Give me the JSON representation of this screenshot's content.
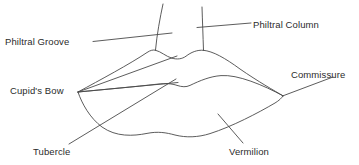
{
  "diagram": {
    "type": "labeled-anatomical-line-drawing",
    "background_color": "#ffffff",
    "stroke_color": "#4a4a4a",
    "text_color": "#2b2b2b",
    "labels": [
      {
        "id": "philtral-groove",
        "text": "Philtral Groove",
        "x": 5,
        "y": 36,
        "anchor": "left",
        "points_to": "groove between the two philtral columns above the upper lip"
      },
      {
        "id": "philtral-column",
        "text": "Philtral Column",
        "x": 253,
        "y": 19,
        "anchor": "left",
        "points_to": "right vertical ridge running from nose to upper lip peak"
      },
      {
        "id": "cupids-bow",
        "text": "Cupid's Bow",
        "x": 10,
        "y": 85,
        "anchor": "left",
        "points_to": "double-peaked curve of the upper vermilion border"
      },
      {
        "id": "commissure",
        "text": "Commissure",
        "x": 291,
        "y": 69,
        "anchor": "left",
        "points_to": "lateral corner where upper and lower lips meet"
      },
      {
        "id": "tubercle",
        "text": "Tubercle",
        "x": 33,
        "y": 146,
        "anchor": "left",
        "points_to": "central fullness of the upper lip"
      },
      {
        "id": "vermilion",
        "text": "Vermilion",
        "x": 229,
        "y": 146,
        "anchor": "left",
        "points_to": "red-coloured body of the lower lip"
      }
    ]
  }
}
